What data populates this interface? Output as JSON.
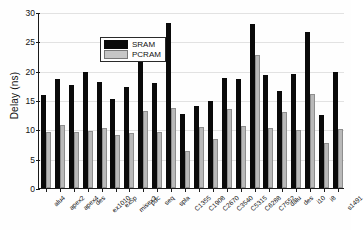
{
  "chart_data": {
    "type": "bar",
    "title": "",
    "xlabel": "",
    "ylabel": "Delay (ns)",
    "ylim": [
      0,
      30
    ],
    "yticks": [
      0,
      5,
      10,
      15,
      20,
      25,
      30
    ],
    "grid": true,
    "legend_position": "upper-left",
    "categories": [
      "alu4",
      "apex2",
      "apex4",
      "des",
      "ex1010",
      "ex5p",
      "misex3",
      "pdc",
      "seq",
      "spla",
      "C1355",
      "C1908",
      "C2670",
      "C3540",
      "C5315",
      "C6288",
      "C7552",
      "dalu",
      "des",
      "i10",
      "i8",
      "s1491"
    ],
    "series": [
      {
        "name": "SRAM",
        "color": "#0a0a0a",
        "values": [
          15.9,
          18.5,
          17.5,
          19.7,
          18.1,
          15.2,
          17.2,
          25.6,
          17.9,
          28.2,
          12.7,
          13.9,
          14.9,
          18.8,
          18.6,
          27.9,
          19.3,
          16.6,
          19.5,
          26.6,
          12.4,
          19.8
        ]
      },
      {
        "name": "PCRAM",
        "color": "#c6c6c6",
        "values": [
          9.6,
          10.8,
          9.6,
          9.8,
          10.3,
          9.1,
          9.3,
          13.1,
          9.5,
          13.7,
          6.3,
          10.4,
          8.3,
          13.4,
          10.6,
          22.7,
          10.3,
          13.0,
          9.9,
          16.0,
          7.6,
          10.0
        ]
      }
    ]
  },
  "legend": {
    "items": [
      {
        "label": "SRAM"
      },
      {
        "label": "PCRAM"
      }
    ]
  }
}
